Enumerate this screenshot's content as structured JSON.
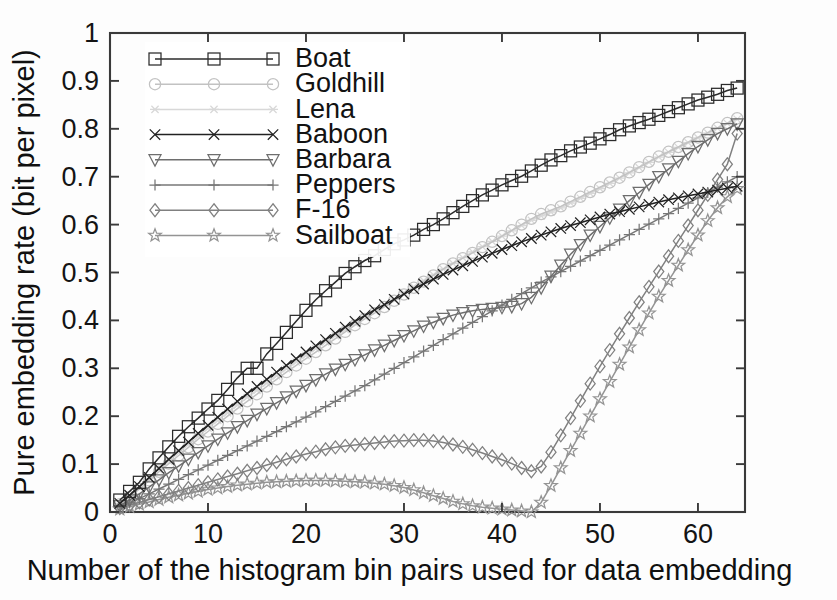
{
  "figure": {
    "background": "#fdfdfd",
    "plot_box": {
      "left": 110,
      "top": 33,
      "right": 745,
      "bottom": 512
    }
  },
  "chart_data": {
    "type": "line",
    "title": "",
    "xlabel": "Number of the histogram bin pairs used for data embedding",
    "ylabel": "Pure embedding rate (bit per pixel)",
    "xlim": [
      0,
      64.8
    ],
    "ylim": [
      0,
      1
    ],
    "xticks": [
      0,
      10,
      20,
      30,
      40,
      50,
      60
    ],
    "xticklabels": [
      "0",
      "10",
      "20",
      "30",
      "40",
      "50",
      "60"
    ],
    "yticks": [
      0,
      0.1,
      0.2,
      0.3,
      0.4,
      0.5,
      0.6,
      0.7,
      0.8,
      0.9,
      1
    ],
    "yticklabels": [
      "0",
      "0.1",
      "0.2",
      "0.3",
      "0.4",
      "0.5",
      "0.6",
      "0.7",
      "0.8",
      "0.9",
      "1"
    ],
    "grid": false,
    "legend_position": "top-left",
    "x": [
      1,
      2,
      3,
      4,
      5,
      6,
      7,
      8,
      9,
      10,
      11,
      12,
      13,
      14,
      15,
      16,
      17,
      18,
      19,
      20,
      21,
      22,
      23,
      24,
      25,
      26,
      27,
      28,
      29,
      30,
      31,
      32,
      33,
      34,
      35,
      36,
      37,
      38,
      39,
      40,
      41,
      42,
      43,
      44,
      45,
      46,
      47,
      48,
      49,
      50,
      51,
      52,
      53,
      54,
      55,
      56,
      57,
      58,
      59,
      60,
      61,
      62,
      63,
      64
    ],
    "series": [
      {
        "name": "Boat",
        "marker": "square",
        "color": "#2b2b2b",
        "values": [
          0.025,
          0.043,
          0.062,
          0.09,
          0.113,
          0.136,
          0.158,
          0.178,
          0.196,
          0.215,
          0.233,
          0.256,
          0.28,
          0.3,
          0.3,
          0.33,
          0.352,
          0.375,
          0.398,
          0.421,
          0.443,
          0.462,
          0.48,
          0.498,
          0.512,
          0.525,
          0.535,
          0.548,
          0.56,
          0.568,
          0.578,
          0.59,
          0.6,
          0.612,
          0.625,
          0.638,
          0.65,
          0.662,
          0.672,
          0.683,
          0.692,
          0.701,
          0.712,
          0.724,
          0.735,
          0.744,
          0.754,
          0.762,
          0.77,
          0.779,
          0.788,
          0.798,
          0.806,
          0.813,
          0.82,
          0.828,
          0.836,
          0.844,
          0.852,
          0.86,
          0.866,
          0.872,
          0.88,
          0.885
        ]
      },
      {
        "name": "Goldhill",
        "marker": "circle",
        "color": "#c2c2c2",
        "values": [
          0.016,
          0.031,
          0.048,
          0.066,
          0.084,
          0.101,
          0.118,
          0.135,
          0.152,
          0.168,
          0.184,
          0.2,
          0.216,
          0.231,
          0.246,
          0.262,
          0.277,
          0.292,
          0.306,
          0.32,
          0.334,
          0.348,
          0.362,
          0.376,
          0.39,
          0.403,
          0.415,
          0.428,
          0.441,
          0.454,
          0.468,
          0.481,
          0.494,
          0.507,
          0.519,
          0.53,
          0.541,
          0.553,
          0.564,
          0.576,
          0.588,
          0.6,
          0.612,
          0.622,
          0.63,
          0.638,
          0.648,
          0.658,
          0.668,
          0.678,
          0.688,
          0.698,
          0.709,
          0.72,
          0.731,
          0.742,
          0.752,
          0.762,
          0.772,
          0.782,
          0.792,
          0.802,
          0.812,
          0.822
        ]
      },
      {
        "name": "Lena",
        "marker": "asterisk",
        "color": "#d8d8d8",
        "values": [
          0.018,
          0.034,
          0.052,
          0.07,
          0.088,
          0.106,
          0.124,
          0.141,
          0.158,
          0.175,
          0.191,
          0.207,
          0.223,
          0.239,
          0.254,
          0.269,
          0.284,
          0.299,
          0.313,
          0.327,
          0.341,
          0.355,
          0.368,
          0.381,
          0.394,
          0.407,
          0.42,
          0.432,
          0.445,
          0.458,
          0.47,
          0.483,
          0.495,
          0.507,
          0.519,
          0.531,
          0.543,
          0.554,
          0.565,
          0.576,
          0.587,
          0.598,
          0.609,
          0.618,
          0.626,
          0.635,
          0.645,
          0.655,
          0.665,
          0.675,
          0.686,
          0.697,
          0.708,
          0.719,
          0.73,
          0.741,
          0.751,
          0.761,
          0.771,
          0.781,
          0.791,
          0.801,
          0.811,
          0.82
        ]
      },
      {
        "name": "Baboon",
        "marker": "x",
        "color": "#222222",
        "values": [
          0.018,
          0.035,
          0.053,
          0.072,
          0.091,
          0.11,
          0.128,
          0.146,
          0.164,
          0.181,
          0.198,
          0.215,
          0.231,
          0.247,
          0.262,
          0.277,
          0.292,
          0.306,
          0.32,
          0.334,
          0.347,
          0.36,
          0.373,
          0.386,
          0.398,
          0.41,
          0.422,
          0.433,
          0.444,
          0.455,
          0.466,
          0.476,
          0.486,
          0.496,
          0.505,
          0.514,
          0.523,
          0.532,
          0.54,
          0.548,
          0.556,
          0.564,
          0.571,
          0.578,
          0.585,
          0.592,
          0.598,
          0.604,
          0.61,
          0.616,
          0.622,
          0.627,
          0.632,
          0.637,
          0.642,
          0.647,
          0.652,
          0.656,
          0.66,
          0.664,
          0.668,
          0.672,
          0.676,
          0.68
        ]
      },
      {
        "name": "Barbara",
        "marker": "triangle-down",
        "color": "#6e6e6e",
        "values": [
          0.013,
          0.025,
          0.038,
          0.052,
          0.067,
          0.082,
          0.096,
          0.11,
          0.124,
          0.138,
          0.152,
          0.165,
          0.178,
          0.191,
          0.204,
          0.216,
          0.228,
          0.24,
          0.252,
          0.264,
          0.276,
          0.288,
          0.298,
          0.308,
          0.318,
          0.328,
          0.338,
          0.348,
          0.358,
          0.368,
          0.378,
          0.388,
          0.396,
          0.404,
          0.411,
          0.416,
          0.42,
          0.423,
          0.425,
          0.427,
          0.429,
          0.435,
          0.448,
          0.468,
          0.492,
          0.515,
          0.538,
          0.558,
          0.578,
          0.596,
          0.614,
          0.632,
          0.65,
          0.667,
          0.684,
          0.7,
          0.716,
          0.732,
          0.748,
          0.763,
          0.777,
          0.79,
          0.8,
          0.81
        ]
      },
      {
        "name": "Peppers",
        "marker": "plus",
        "color": "#777777",
        "values": [
          0.01,
          0.019,
          0.028,
          0.038,
          0.048,
          0.058,
          0.068,
          0.078,
          0.088,
          0.098,
          0.108,
          0.118,
          0.128,
          0.138,
          0.148,
          0.158,
          0.168,
          0.178,
          0.188,
          0.198,
          0.209,
          0.22,
          0.231,
          0.242,
          0.253,
          0.264,
          0.276,
          0.288,
          0.3,
          0.312,
          0.324,
          0.336,
          0.348,
          0.36,
          0.372,
          0.384,
          0.396,
          0.408,
          0.42,
          0.432,
          0.444,
          0.456,
          0.468,
          0.48,
          0.491,
          0.502,
          0.513,
          0.524,
          0.535,
          0.546,
          0.557,
          0.568,
          0.579,
          0.59,
          0.601,
          0.612,
          0.623,
          0.634,
          0.645,
          0.656,
          0.667,
          0.678,
          0.689,
          0.7
        ]
      },
      {
        "name": "F-16",
        "marker": "diamond",
        "color": "#808080",
        "values": [
          0.008,
          0.014,
          0.02,
          0.026,
          0.032,
          0.038,
          0.044,
          0.05,
          0.056,
          0.062,
          0.068,
          0.074,
          0.08,
          0.086,
          0.092,
          0.098,
          0.104,
          0.11,
          0.116,
          0.121,
          0.126,
          0.131,
          0.135,
          0.138,
          0.14,
          0.142,
          0.144,
          0.146,
          0.148,
          0.149,
          0.15,
          0.15,
          0.148,
          0.145,
          0.141,
          0.136,
          0.13,
          0.123,
          0.116,
          0.109,
          0.101,
          0.092,
          0.085,
          0.095,
          0.125,
          0.16,
          0.196,
          0.232,
          0.268,
          0.304,
          0.338,
          0.372,
          0.405,
          0.438,
          0.47,
          0.502,
          0.534,
          0.566,
          0.598,
          0.63,
          0.662,
          0.694,
          0.726,
          0.79
        ]
      },
      {
        "name": "Sailboat",
        "marker": "star",
        "color": "#949494",
        "values": [
          0.006,
          0.011,
          0.016,
          0.021,
          0.026,
          0.031,
          0.035,
          0.039,
          0.043,
          0.047,
          0.05,
          0.053,
          0.056,
          0.058,
          0.06,
          0.062,
          0.063,
          0.064,
          0.065,
          0.066,
          0.066,
          0.066,
          0.065,
          0.064,
          0.063,
          0.062,
          0.06,
          0.058,
          0.055,
          0.051,
          0.046,
          0.04,
          0.034,
          0.028,
          0.022,
          0.017,
          0.013,
          0.01,
          0.008,
          0.006,
          0.004,
          0.002,
          0.0,
          0.02,
          0.055,
          0.092,
          0.128,
          0.164,
          0.2,
          0.236,
          0.272,
          0.308,
          0.344,
          0.38,
          0.415,
          0.45,
          0.483,
          0.515,
          0.547,
          0.578,
          0.608,
          0.635,
          0.658,
          0.675
        ]
      }
    ]
  },
  "legend": {
    "entries": [
      {
        "label": "Boat",
        "marker": "square",
        "color": "#2b2b2b"
      },
      {
        "label": "Goldhill",
        "marker": "circle",
        "color": "#c2c2c2"
      },
      {
        "label": "Lena",
        "marker": "asterisk",
        "color": "#d8d8d8"
      },
      {
        "label": "Baboon",
        "marker": "x",
        "color": "#222222"
      },
      {
        "label": "Barbara",
        "marker": "triangle-down",
        "color": "#6e6e6e"
      },
      {
        "label": "Peppers",
        "marker": "plus",
        "color": "#777777"
      },
      {
        "label": "F-16",
        "marker": "diamond",
        "color": "#808080"
      },
      {
        "label": "Sailboat",
        "marker": "star",
        "color": "#949494"
      }
    ]
  }
}
